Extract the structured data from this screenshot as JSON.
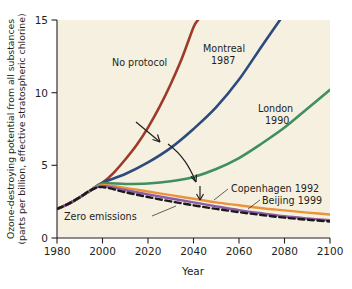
{
  "chart_data": {
    "type": "line",
    "title": "",
    "xlabel": "Year",
    "ylabel": "Ozone-destroying potential from all substances (parts per billion, effective stratospheric chlorine)",
    "ylabel_line1": "Ozone-destroying potential from all substances",
    "ylabel_line2": "(parts per billion, effective stratospheric chlorine)",
    "xlim": [
      1980,
      2100
    ],
    "ylim": [
      0,
      15
    ],
    "xticks": [
      1980,
      2000,
      2020,
      2040,
      2060,
      2080,
      2100
    ],
    "xtick_labels": [
      "1980",
      "2000",
      "2020",
      "2040",
      "2060",
      "2080",
      "2100"
    ],
    "yticks": [
      0,
      5,
      10,
      15
    ],
    "ytick_labels": [
      "0",
      "5",
      "10",
      "15"
    ],
    "grid": false,
    "legend": "inline-labels",
    "background_color": "#f6f0e1",
    "series": [
      {
        "name": "No protocol",
        "label": "No protocol",
        "color": "#9c3b29",
        "style": "solid",
        "width": 2.6,
        "x": [
          1980,
          1985,
          1990,
          1995,
          2000,
          2005,
          2010,
          2015,
          2020,
          2025,
          2030,
          2035,
          2040,
          2042
        ],
        "values": [
          2.0,
          2.35,
          2.8,
          3.3,
          3.8,
          4.5,
          5.4,
          6.4,
          7.6,
          9.0,
          10.6,
          12.4,
          14.5,
          15.0
        ]
      },
      {
        "name": "Montreal 1987",
        "label_line1": "Montreal",
        "label_line2": "1987",
        "color": "#2c4a7c",
        "style": "solid",
        "width": 2.6,
        "x": [
          1980,
          1985,
          1990,
          1995,
          2000,
          2010,
          2020,
          2030,
          2040,
          2050,
          2060,
          2070,
          2078
        ],
        "values": [
          2.0,
          2.35,
          2.8,
          3.3,
          3.8,
          4.4,
          5.2,
          6.2,
          7.5,
          9.0,
          10.9,
          13.2,
          15.0
        ]
      },
      {
        "name": "London 1990",
        "label_line1": "London",
        "label_line2": "1990",
        "color": "#3f8f5f",
        "style": "solid",
        "width": 2.6,
        "x": [
          1980,
          1985,
          1990,
          1995,
          2000,
          2010,
          2020,
          2030,
          2040,
          2050,
          2060,
          2070,
          2080,
          2090,
          2100
        ],
        "values": [
          2.0,
          2.35,
          2.8,
          3.3,
          3.75,
          3.72,
          3.75,
          3.9,
          4.2,
          4.75,
          5.5,
          6.5,
          7.6,
          8.9,
          10.2
        ]
      },
      {
        "name": "Copenhagen 1992",
        "label": "Copenhagen 1992",
        "color": "#e8943a",
        "style": "solid",
        "width": 2.4,
        "x": [
          1980,
          1985,
          1990,
          1995,
          2000,
          2010,
          2020,
          2030,
          2040,
          2050,
          2060,
          2070,
          2080,
          2090,
          2100
        ],
        "values": [
          2.0,
          2.35,
          2.8,
          3.3,
          3.65,
          3.45,
          3.2,
          2.95,
          2.7,
          2.45,
          2.25,
          2.05,
          1.9,
          1.75,
          1.62
        ]
      },
      {
        "name": "Beijing 1999",
        "label": "Beijing 1999",
        "color": "#8e5aa8",
        "style": "solid",
        "width": 2.4,
        "x": [
          1980,
          1985,
          1990,
          1995,
          2000,
          2010,
          2020,
          2030,
          2040,
          2050,
          2060,
          2070,
          2080,
          2090,
          2100
        ],
        "values": [
          2.0,
          2.35,
          2.8,
          3.3,
          3.58,
          3.3,
          3.0,
          2.72,
          2.45,
          2.18,
          1.92,
          1.7,
          1.5,
          1.35,
          1.22
        ]
      },
      {
        "name": "Zero emissions",
        "label": "Zero emissions",
        "color": "#1a1a1a",
        "style": "dashed",
        "width": 2.4,
        "x": [
          1980,
          1985,
          1990,
          1995,
          2000,
          2010,
          2020,
          2030,
          2040,
          2050,
          2060,
          2070,
          2080,
          2090,
          2100
        ],
        "values": [
          2.0,
          2.35,
          2.8,
          3.3,
          3.5,
          3.15,
          2.82,
          2.52,
          2.25,
          2.0,
          1.78,
          1.58,
          1.4,
          1.26,
          1.14
        ]
      }
    ],
    "annotations": [
      {
        "name": "arrow-no-protocol-to-montreal",
        "type": "arrow"
      },
      {
        "name": "arrow-montreal-to-london",
        "type": "curved-arrow"
      },
      {
        "name": "arrow-london-to-lower",
        "type": "arrow"
      },
      {
        "name": "leader-copenhagen",
        "type": "leader-line"
      },
      {
        "name": "leader-beijing",
        "type": "leader-line"
      },
      {
        "name": "leader-zero-emissions",
        "type": "leader-line"
      }
    ]
  }
}
